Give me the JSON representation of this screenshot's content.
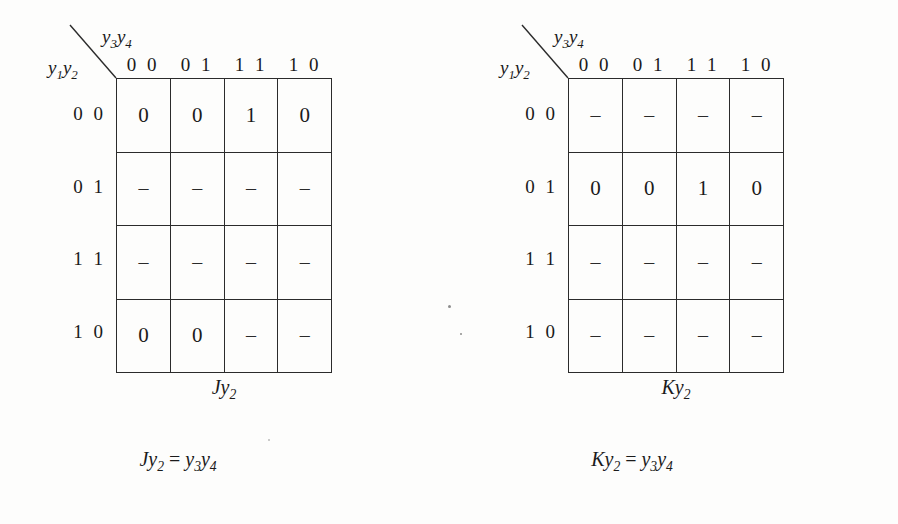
{
  "figure": {
    "row_variable_label": "y1y2",
    "col_variable_label": "y3y4",
    "column_headers": [
      "0 0",
      "0 1",
      "1 1",
      "1 0"
    ],
    "row_headers": [
      "0 0",
      "0 1",
      "1 1",
      "1 0"
    ]
  },
  "maps": [
    {
      "id": "jy2",
      "caption_base": "J",
      "caption_var": "y",
      "caption_sub": "2",
      "rows": [
        [
          "0",
          "0",
          "1",
          "0"
        ],
        [
          "–",
          "–",
          "–",
          "–"
        ],
        [
          "–",
          "–",
          "–",
          "–"
        ],
        [
          "0",
          "0",
          "–",
          "–"
        ]
      ],
      "equation": {
        "lhs_base": "J",
        "lhs_var": "y",
        "lhs_sub": "2",
        "operator": "=",
        "rhs_var1": "y",
        "rhs_sub1": "3",
        "rhs_var2": "y",
        "rhs_sub2": "4"
      }
    },
    {
      "id": "ky2",
      "caption_base": "K",
      "caption_var": "y",
      "caption_sub": "2",
      "rows": [
        [
          "–",
          "–",
          "–",
          "–"
        ],
        [
          "0",
          "0",
          "1",
          "0"
        ],
        [
          "–",
          "–",
          "–",
          "–"
        ],
        [
          "–",
          "–",
          "–",
          "–"
        ]
      ],
      "equation": {
        "lhs_base": "K",
        "lhs_var": "y",
        "lhs_sub": "2",
        "operator": "=",
        "rhs_var1": "y",
        "rhs_sub1": "3",
        "rhs_var2": "y",
        "rhs_sub2": "4"
      }
    }
  ],
  "colors": {
    "grid_line": "#2b2b2b",
    "text": "#1a1a1a",
    "background": "#fdfdfc"
  }
}
